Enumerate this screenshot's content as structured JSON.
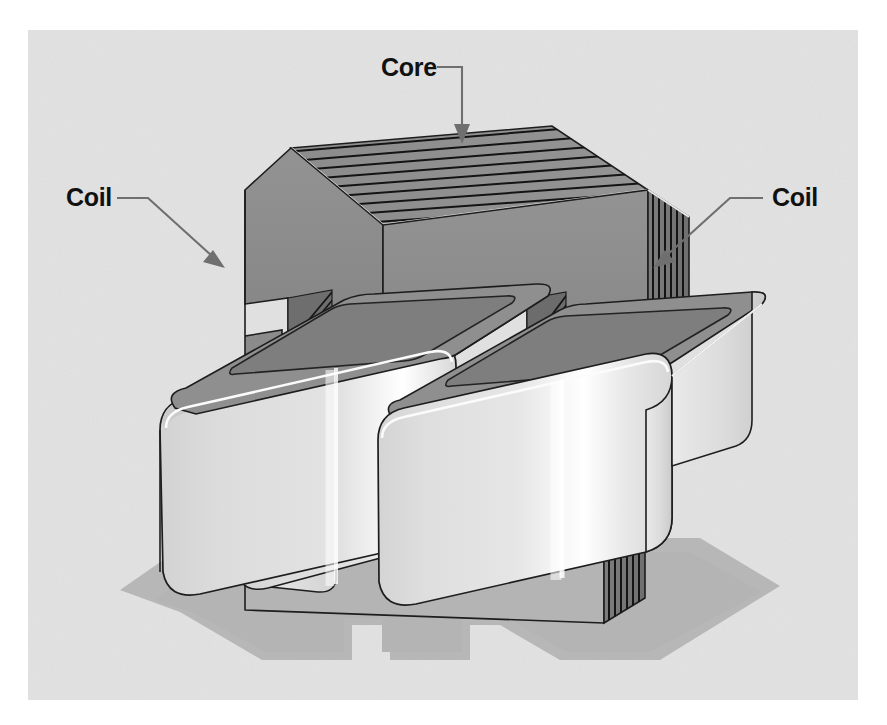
{
  "figure": {
    "background_color": "#ffffff",
    "panel_color": "#e2e2e2",
    "panel_rect": {
      "x": 28,
      "y": 30,
      "width": 830,
      "height": 670
    }
  },
  "labels": [
    {
      "id": "core",
      "text": "Core",
      "text_x": 381,
      "text_y": 76,
      "anchor": "start",
      "leader_path": "M437,67 L462,67 L462,128",
      "arrow_points": "462,144 454,124 470,124",
      "arrow_direction": "down",
      "points_to": "core-top-face"
    },
    {
      "id": "coil-left",
      "text": "Coil",
      "text_x": 66,
      "text_y": 206,
      "anchor": "start",
      "leader_path": "M117,198 L148,198 L212,256",
      "arrow_points": "225,268 203,262 213,250",
      "arrow_direction": "down-right",
      "points_to": "left-coil-top-edge"
    },
    {
      "id": "coil-right",
      "text": "Coil",
      "text_x": 772,
      "text_y": 206,
      "anchor": "start",
      "leader_path": "M763,198 L730,198 L666,256",
      "arrow_points": "653,268 675,262 665,250",
      "arrow_direction": "down-left",
      "points_to": "right-coil-top-edge"
    }
  ],
  "colors": {
    "panel_bg": "#e2e2e2",
    "shadow": "#b4b4b4",
    "core_top_face": "#8e8e8e",
    "core_front_face": "#8a8a8a",
    "core_right_face": "#787878",
    "core_lamination_line": "#141414",
    "coil_body_light": "#dedede",
    "coil_body_highlight": "#fdfdfd",
    "coil_top_face": "#909090",
    "coil_inner_wall": "#9a9a9a",
    "outline": "#1d1d1d",
    "leader": "#6f6f6f",
    "label_text": "#111111"
  },
  "parts": {
    "core": {
      "name": "Core",
      "description": "Laminated E/I steel core, U shape with upper yoke and lower leg",
      "lamination_count_top": 9,
      "lamination_count_side": 8
    },
    "coil_left": {
      "name": "Coil",
      "description": "Left rounded rectangular winding block surrounding the core limb"
    },
    "coil_right": {
      "name": "Coil",
      "description": "Right rounded rectangular winding block surrounding the core limb"
    }
  }
}
